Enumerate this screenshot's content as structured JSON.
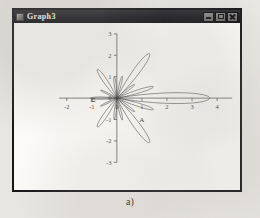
{
  "window": {
    "title": "Graph3",
    "icon": "graph-window-icon",
    "controls": [
      {
        "name": "minimize-button",
        "glyph": "minimize-icon"
      },
      {
        "name": "maximize-button",
        "glyph": "maximize-icon"
      },
      {
        "name": "close-button",
        "glyph": "close-icon"
      }
    ]
  },
  "toolbar": {
    "layer_button_label": "1",
    "combo_value": "",
    "combo_arrow_icon": "chevron-down-icon"
  },
  "caption": "a)",
  "chart_data": {
    "type": "line",
    "title": "",
    "subtitle": "",
    "xlabel": "A",
    "ylabel": "B",
    "xlim": [
      -2.3,
      4.6
    ],
    "ylim": [
      -3,
      3
    ],
    "xticks": [
      -2,
      -1,
      0,
      1,
      2,
      3,
      4
    ],
    "xticklabels": [
      "-2",
      "-1",
      "0",
      "1",
      "2",
      "3",
      "4"
    ],
    "yticks": [
      -3,
      -2,
      -1,
      0,
      1,
      2,
      3
    ],
    "yticklabels": [
      "-3",
      "-2",
      "-1",
      "0",
      "1",
      "2",
      "3"
    ],
    "grid": false,
    "legend": null,
    "annotations": [],
    "lobes": [
      {
        "name": "main-lobe",
        "angle_deg": 0,
        "radius": 3.7,
        "half_width_deg": 11
      },
      {
        "name": "side-lobe-r1",
        "angle_deg": 20,
        "radius": 1.55,
        "half_width_deg": 8
      },
      {
        "name": "side-lobe-r2",
        "angle_deg": -20,
        "radius": 1.55,
        "half_width_deg": 8
      },
      {
        "name": "side-lobe-r3",
        "angle_deg": 42,
        "radius": 0.95,
        "half_width_deg": 7
      },
      {
        "name": "side-lobe-r4",
        "angle_deg": -42,
        "radius": 0.95,
        "half_width_deg": 7
      },
      {
        "name": "upper-lobe-a",
        "angle_deg": 58,
        "radius": 2.45,
        "half_width_deg": 9
      },
      {
        "name": "lower-lobe-a",
        "angle_deg": -58,
        "radius": 2.45,
        "half_width_deg": 9
      },
      {
        "name": "upper-lobe-b",
        "angle_deg": 78,
        "radius": 1.05,
        "half_width_deg": 6
      },
      {
        "name": "lower-lobe-b",
        "angle_deg": -78,
        "radius": 1.05,
        "half_width_deg": 6
      },
      {
        "name": "upper-lobe-c",
        "angle_deg": 96,
        "radius": 1.0,
        "half_width_deg": 6
      },
      {
        "name": "lower-lobe-c",
        "angle_deg": -96,
        "radius": 1.0,
        "half_width_deg": 6
      },
      {
        "name": "upper-lobe-d",
        "angle_deg": 120,
        "radius": 1.55,
        "half_width_deg": 9
      },
      {
        "name": "lower-lobe-d",
        "angle_deg": -120,
        "radius": 1.55,
        "half_width_deg": 9
      },
      {
        "name": "back-lobe-up",
        "angle_deg": 150,
        "radius": 0.75,
        "half_width_deg": 7
      },
      {
        "name": "back-lobe-dn",
        "angle_deg": -150,
        "radius": 0.75,
        "half_width_deg": 7
      },
      {
        "name": "back-lobe",
        "angle_deg": 180,
        "radius": 1.05,
        "half_width_deg": 8
      }
    ]
  }
}
